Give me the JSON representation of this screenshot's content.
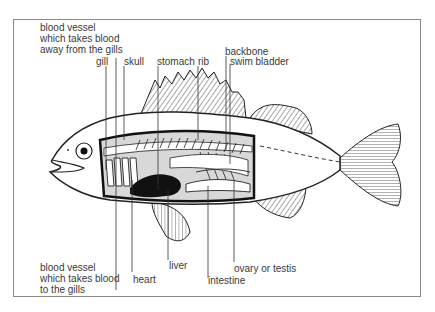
{
  "diagram": {
    "labels": {
      "vessel_from_gills": "blood vessel\nwhich takes blood\naway from the gills",
      "gill": "gill",
      "skull": "skull",
      "stomach": "stomach",
      "rib": "rib",
      "backbone": "backbone",
      "swim_bladder": "swim bladder",
      "vessel_to_gills": "blood vessel\nwhich takes blood\nto the gills",
      "heart": "heart",
      "liver": "liver",
      "intestine": "intestine",
      "ovary_testis": "ovary or testis"
    },
    "colors": {
      "ink": "#222222",
      "label": "#3a3a3a",
      "cavity_fill": "#d8d8d8",
      "frame": "#8a8a8a"
    }
  }
}
